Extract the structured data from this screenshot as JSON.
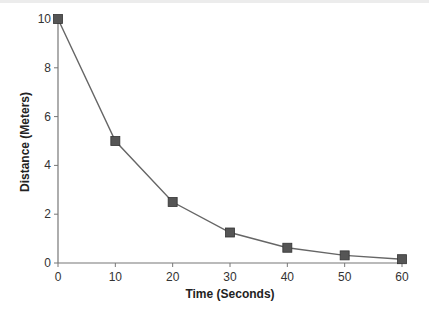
{
  "chart_data": {
    "type": "line",
    "title": "",
    "xlabel": "Time (Seconds)",
    "ylabel": "Distance (Meters)",
    "x": [
      0,
      10,
      20,
      30,
      40,
      50,
      60
    ],
    "series": [
      {
        "name": "Distance",
        "values": [
          10,
          5,
          2.5,
          1.25,
          0.625,
          0.3125,
          0.15625
        ],
        "marker": "square",
        "color": "#555555"
      }
    ],
    "xlim": [
      0,
      60
    ],
    "ylim": [
      0,
      10
    ],
    "xticks": [
      0,
      10,
      20,
      30,
      40,
      50,
      60
    ],
    "yticks": [
      0,
      2,
      4,
      6,
      8,
      10
    ],
    "grid": false,
    "legend": null
  },
  "axes": {
    "x_title": "Time (Seconds)",
    "y_title": "Distance (Meters)",
    "x_tick_labels": [
      "0",
      "10",
      "20",
      "30",
      "40",
      "50",
      "60"
    ],
    "y_tick_labels": [
      "0",
      "2",
      "4",
      "6",
      "8",
      "10"
    ]
  },
  "colors": {
    "axis": "#777777",
    "line": "#666666",
    "marker_fill": "#555555",
    "marker_stroke": "#333333",
    "text": "#333333"
  }
}
